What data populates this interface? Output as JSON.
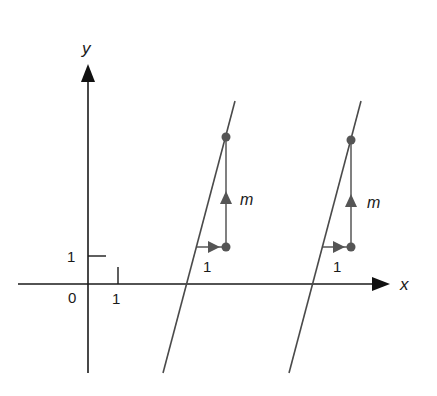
{
  "colors": {
    "axis": "#1a1a1a",
    "line": "#4a4a4a",
    "marker": "#555555",
    "text": "#1a1a1a"
  },
  "axes": {
    "x_label": "x",
    "y_label": "y",
    "origin_label": "0",
    "x_tick_label": "1",
    "y_tick_label": "1"
  },
  "lines": [
    {
      "name": "line-1",
      "run_label": "1",
      "rise_label": "m"
    },
    {
      "name": "line-2",
      "run_label": "1",
      "rise_label": "m"
    }
  ]
}
